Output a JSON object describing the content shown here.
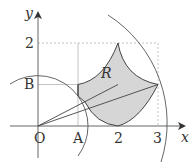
{
  "diagram": {
    "axes": {
      "x_label": "x",
      "y_label": "y",
      "origin_label": "O"
    },
    "ticks": {
      "x": [
        {
          "label": "A",
          "value": 1
        },
        {
          "label": "2",
          "value": 2
        },
        {
          "label": "3",
          "value": 3
        }
      ],
      "y": [
        {
          "label": "B",
          "value": 1
        },
        {
          "label": "2",
          "value": 2
        }
      ]
    },
    "region_label": "R",
    "colors": {
      "region_fill": "#d6d6d6",
      "stroke": "#444444",
      "guide": "#aaaaaa"
    }
  }
}
